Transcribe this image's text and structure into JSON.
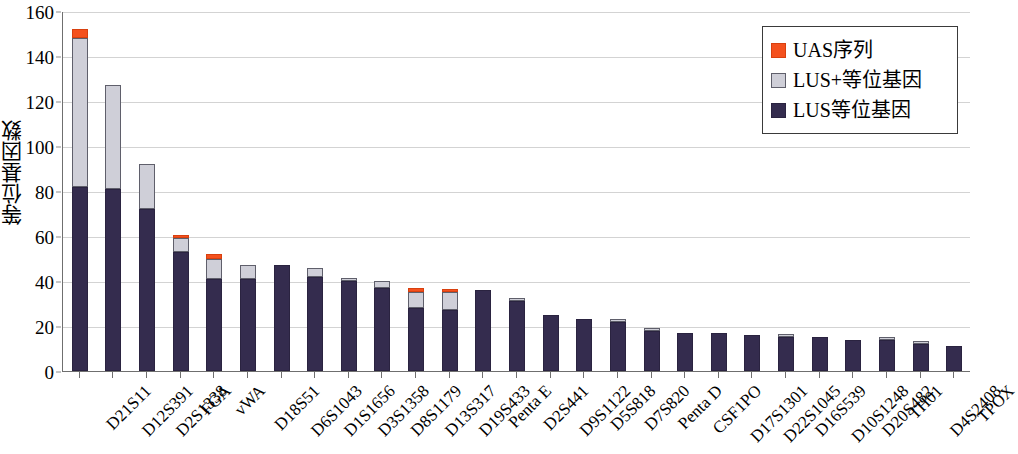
{
  "chart_data": {
    "type": "bar",
    "stacked": true,
    "title": "",
    "xlabel": "",
    "ylabel": "等位基因数",
    "ylim": [
      0,
      160
    ],
    "ytick_step": 20,
    "yticks": [
      0,
      20,
      40,
      60,
      80,
      100,
      120,
      140,
      160
    ],
    "grid": true,
    "legend_position": "top-right",
    "categories": [
      "D21S11",
      "D12S391",
      "D2S1338",
      "FGA",
      "vWA",
      "D18S51",
      "D6S1043",
      "D1S1656",
      "D3S1358",
      "D8S1179",
      "D13S317",
      "D19S433",
      "Penta E",
      "D2S441",
      "D9S1122",
      "D5S818",
      "D7S820",
      "Penta D",
      "CSF1PO",
      "D17S1301",
      "D22S1045",
      "D16S539",
      "D10S1248",
      "D20S482",
      "TH01",
      "D4S2408",
      "TPOX"
    ],
    "series": [
      {
        "name": "LUS等位基因",
        "color": "#342c4e",
        "values": [
          82,
          81,
          72,
          53,
          41,
          41,
          47,
          42,
          40,
          37,
          28,
          27,
          36,
          31,
          25,
          23,
          22,
          18,
          17,
          17,
          16,
          15,
          15,
          14,
          14,
          12,
          11
        ]
      },
      {
        "name": "LUS+等位基因",
        "color": "#cfcfd8",
        "values": [
          66,
          46,
          20,
          6,
          9,
          6,
          0,
          4,
          1,
          3,
          7,
          8,
          0,
          1,
          0,
          0,
          1,
          1,
          0,
          0,
          0,
          1,
          0,
          0,
          1,
          1,
          0
        ]
      },
      {
        "name": "UAS序列",
        "color": "#f4511e",
        "values": [
          4,
          0,
          0,
          1,
          2,
          0,
          0,
          0,
          0,
          0,
          2,
          1,
          0,
          0,
          0,
          0,
          0,
          0,
          0,
          0,
          0,
          0,
          0,
          0,
          0,
          0,
          0
        ]
      }
    ],
    "totals": [
      152,
      127,
      92,
      60,
      52,
      47,
      47,
      46,
      41,
      40,
      37,
      36,
      36,
      32,
      25,
      23,
      23,
      19,
      17,
      17,
      16,
      16,
      15,
      14,
      15,
      13,
      11
    ]
  },
  "legend": {
    "items": [
      {
        "label": "UAS序列",
        "swatch": "uas"
      },
      {
        "label": "LUS+等位基因",
        "swatch": "lusplus"
      },
      {
        "label": "LUS等位基因",
        "swatch": "lus"
      }
    ]
  }
}
